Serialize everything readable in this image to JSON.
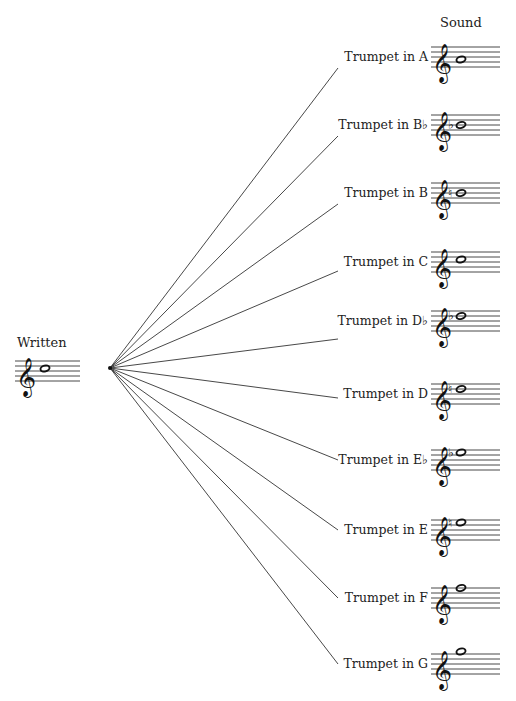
{
  "written": {
    "label": "Written",
    "pitch": "C5",
    "accidental": ""
  },
  "sound_heading": "Sound",
  "colors": {
    "ink": "#222222",
    "lines": "#333333",
    "background": "#ffffff"
  },
  "instruments": [
    {
      "label": "Trumpet in A",
      "key": "A",
      "sounding_pitch": "A4",
      "accidental": "",
      "line_end_y": 68
    },
    {
      "label": "Trumpet in B♭",
      "key": "B♭",
      "sounding_pitch": "B♭4",
      "accidental": "flat",
      "line_end_y": 136
    },
    {
      "label": "Trumpet in B",
      "key": "B",
      "sounding_pitch": "B4",
      "accidental": "natural",
      "line_end_y": 204
    },
    {
      "label": "Trumpet in C",
      "key": "C",
      "sounding_pitch": "C5",
      "accidental": "",
      "line_end_y": 271
    },
    {
      "label": "Trumpet in D♭",
      "key": "D♭",
      "sounding_pitch": "D♭5",
      "accidental": "flat",
      "line_end_y": 339
    },
    {
      "label": "Trumpet in D",
      "key": "D",
      "sounding_pitch": "D5",
      "accidental": "natural",
      "line_end_y": 398
    },
    {
      "label": "Trumpet in E♭",
      "key": "E♭",
      "sounding_pitch": "E♭5",
      "accidental": "flat",
      "line_end_y": 460
    },
    {
      "label": "Trumpet in E",
      "key": "E",
      "sounding_pitch": "E5",
      "accidental": "natural",
      "line_end_y": 530
    },
    {
      "label": "Trumpet in F",
      "key": "F",
      "sounding_pitch": "F5",
      "accidental": "",
      "line_end_y": 598
    },
    {
      "label": "Trumpet in G",
      "key": "G",
      "sounding_pitch": "G5",
      "accidental": "",
      "line_end_y": 664
    }
  ]
}
